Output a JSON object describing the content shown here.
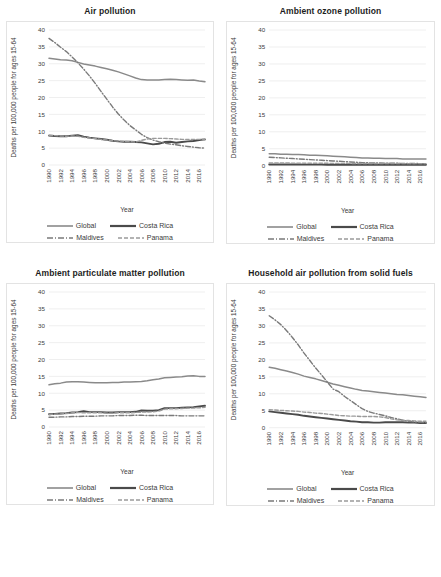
{
  "figure": {
    "caption": "",
    "series_names": [
      "Global",
      "Costa Rica",
      "Maldives",
      "Panama"
    ],
    "axis": {
      "ylabel": "Deaths per 100,000 people for ages 15-64",
      "xlabel": "Year",
      "yticks": [
        "0",
        "5",
        "10",
        "15",
        "20",
        "25",
        "30",
        "35",
        "40"
      ],
      "xticks": [
        "1990",
        "1992",
        "1994",
        "1996",
        "1998",
        "2000",
        "2002",
        "2004",
        "2006",
        "2008",
        "2010",
        "2012",
        "2014",
        "2016"
      ]
    },
    "legend": {
      "global_label": "Global",
      "costa_rica_label": "Costa Rica",
      "maldives_label": "Maldives",
      "panama_label": "Panama"
    },
    "colors": {
      "global": "#8a8a8a",
      "costa_rica": "#4a4a4a",
      "maldives": "#7a7a7a",
      "panama": "#9a9a9a",
      "grid": "#e8e8e8",
      "panel_border": "#e3e3e3",
      "text": "#3b3b3b"
    }
  },
  "chart_data": [
    {
      "type": "line",
      "title": "Air pollution",
      "xlabel": "Year",
      "ylabel": "Deaths per 100,000 people for ages 15-64",
      "ylim": [
        0,
        40
      ],
      "yticks": [
        0,
        5,
        10,
        15,
        20,
        25,
        30,
        35,
        40
      ],
      "grid": true,
      "legend_position": "bottom",
      "x": [
        1990,
        1991,
        1992,
        1993,
        1994,
        1995,
        1996,
        1997,
        1998,
        1999,
        2000,
        2001,
        2002,
        2003,
        2004,
        2005,
        2006,
        2007,
        2008,
        2009,
        2010,
        2011,
        2012,
        2013,
        2014,
        2015,
        2016,
        2017
      ],
      "series": [
        {
          "name": "Global",
          "style": "solid",
          "values": [
            31.6,
            31.4,
            31.2,
            31.1,
            30.9,
            30.4,
            29.9,
            29.6,
            29.3,
            28.9,
            28.5,
            28.1,
            27.6,
            27.0,
            26.4,
            25.8,
            25.3,
            25.2,
            25.2,
            25.2,
            25.3,
            25.4,
            25.3,
            25.2,
            25.1,
            25.2,
            24.9,
            24.7
          ]
        },
        {
          "name": "Costa Rica",
          "style": "solid",
          "values": [
            8.7,
            8.6,
            8.5,
            8.5,
            8.7,
            8.8,
            8.4,
            8.1,
            7.9,
            7.7,
            7.5,
            7.2,
            7.0,
            6.9,
            6.9,
            6.8,
            6.7,
            6.4,
            6.1,
            6.3,
            6.8,
            6.9,
            6.6,
            6.8,
            7.0,
            7.1,
            7.4,
            7.6
          ]
        },
        {
          "name": "Maldives",
          "style": "dashdot",
          "values": [
            37.5,
            36.3,
            34.9,
            33.6,
            32.0,
            30.3,
            28.4,
            26.4,
            24.2,
            21.8,
            19.5,
            17.2,
            15.1,
            13.3,
            11.7,
            10.4,
            9.1,
            8.1,
            7.4,
            6.9,
            6.5,
            6.2,
            6.0,
            5.7,
            5.5,
            5.3,
            5.1,
            5.0
          ]
        },
        {
          "name": "Panama",
          "style": "dashed",
          "values": [
            8.8,
            8.7,
            8.6,
            8.5,
            8.6,
            8.5,
            8.2,
            8.0,
            7.8,
            7.6,
            7.4,
            7.2,
            7.1,
            7.0,
            6.9,
            6.8,
            7.3,
            7.7,
            7.9,
            7.9,
            7.9,
            7.8,
            7.7,
            7.6,
            7.6,
            7.6,
            7.6,
            7.5
          ]
        }
      ]
    },
    {
      "type": "line",
      "title": "Ambient ozone pollution",
      "xlabel": "Year",
      "ylabel": "Deaths per 100,000 people for ages 15-64",
      "ylim": [
        0,
        40
      ],
      "yticks": [
        0,
        5,
        10,
        15,
        20,
        25,
        30,
        35,
        40
      ],
      "grid": true,
      "legend_position": "bottom",
      "x": [
        1990,
        1991,
        1992,
        1993,
        1994,
        1995,
        1996,
        1997,
        1998,
        1999,
        2000,
        2001,
        2002,
        2003,
        2004,
        2005,
        2006,
        2007,
        2008,
        2009,
        2010,
        2011,
        2012,
        2013,
        2014,
        2015,
        2016,
        2017
      ],
      "series": [
        {
          "name": "Global",
          "style": "solid",
          "values": [
            3.5,
            3.5,
            3.4,
            3.4,
            3.3,
            3.3,
            3.2,
            3.1,
            3.1,
            3.0,
            2.9,
            2.8,
            2.7,
            2.6,
            2.5,
            2.4,
            2.3,
            2.3,
            2.2,
            2.2,
            2.1,
            2.1,
            2.1,
            2.0,
            2.0,
            2.0,
            2.0,
            2.0
          ]
        },
        {
          "name": "Costa Rica",
          "style": "solid",
          "values": [
            0.35,
            0.35,
            0.34,
            0.34,
            0.33,
            0.33,
            0.32,
            0.32,
            0.31,
            0.31,
            0.3,
            0.3,
            0.3,
            0.29,
            0.29,
            0.29,
            0.28,
            0.28,
            0.28,
            0.28,
            0.28,
            0.27,
            0.27,
            0.27,
            0.27,
            0.27,
            0.27,
            0.27
          ]
        },
        {
          "name": "Maldives",
          "style": "dashdot",
          "values": [
            2.5,
            2.4,
            2.3,
            2.2,
            2.1,
            2.0,
            1.9,
            1.8,
            1.7,
            1.6,
            1.5,
            1.4,
            1.3,
            1.2,
            1.1,
            1.0,
            0.9,
            0.85,
            0.8,
            0.78,
            0.75,
            0.72,
            0.7,
            0.68,
            0.66,
            0.64,
            0.62,
            0.6
          ]
        },
        {
          "name": "Panama",
          "style": "dashed",
          "values": [
            0.8,
            0.8,
            0.78,
            0.78,
            0.76,
            0.75,
            0.74,
            0.73,
            0.72,
            0.71,
            0.7,
            0.69,
            0.68,
            0.68,
            0.67,
            0.66,
            0.66,
            0.65,
            0.65,
            0.64,
            0.64,
            0.63,
            0.63,
            0.62,
            0.62,
            0.62,
            0.61,
            0.61
          ]
        }
      ]
    },
    {
      "type": "line",
      "title": "Ambient particulate matter pollution",
      "xlabel": "Year",
      "ylabel": "Deaths per 100,000 people for ages 15-64",
      "ylim": [
        0,
        40
      ],
      "yticks": [
        0,
        5,
        10,
        15,
        20,
        25,
        30,
        35,
        40
      ],
      "grid": true,
      "legend_position": "bottom",
      "x": [
        1990,
        1991,
        1992,
        1993,
        1994,
        1995,
        1996,
        1997,
        1998,
        1999,
        2000,
        2001,
        2002,
        2003,
        2004,
        2005,
        2006,
        2007,
        2008,
        2009,
        2010,
        2011,
        2012,
        2013,
        2014,
        2015,
        2016,
        2017
      ],
      "series": [
        {
          "name": "Global",
          "style": "solid",
          "values": [
            12.5,
            12.8,
            13.0,
            13.3,
            13.4,
            13.4,
            13.3,
            13.2,
            13.1,
            13.1,
            13.1,
            13.2,
            13.2,
            13.3,
            13.3,
            13.4,
            13.5,
            13.7,
            14.0,
            14.2,
            14.6,
            14.7,
            14.8,
            14.9,
            15.1,
            15.2,
            15.0,
            15.0
          ]
        },
        {
          "name": "Costa Rica",
          "style": "solid",
          "values": [
            3.8,
            3.9,
            4.0,
            4.1,
            4.3,
            4.4,
            4.7,
            4.4,
            4.4,
            4.4,
            4.3,
            4.3,
            4.4,
            4.4,
            4.4,
            4.5,
            4.9,
            4.8,
            4.8,
            5.0,
            5.6,
            5.6,
            5.6,
            5.7,
            5.8,
            5.9,
            6.1,
            6.3
          ]
        },
        {
          "name": "Maldives",
          "style": "dashdot",
          "values": [
            2.9,
            2.9,
            3.0,
            3.0,
            3.1,
            3.1,
            3.2,
            3.2,
            3.2,
            3.3,
            3.3,
            3.3,
            3.4,
            3.4,
            3.4,
            3.5,
            3.5,
            3.4,
            3.4,
            3.4,
            3.4,
            3.4,
            3.4,
            3.3,
            3.3,
            3.3,
            3.3,
            3.3
          ]
        },
        {
          "name": "Panama",
          "style": "dashed",
          "values": [
            3.7,
            3.8,
            3.9,
            4.0,
            4.2,
            4.3,
            4.2,
            4.2,
            4.2,
            4.2,
            4.1,
            4.1,
            4.2,
            4.2,
            4.2,
            4.3,
            4.4,
            4.4,
            4.5,
            4.7,
            5.3,
            5.4,
            5.4,
            5.5,
            5.6,
            5.6,
            5.7,
            5.8
          ]
        }
      ]
    },
    {
      "type": "line",
      "title": "Household air pollution from solid fuels",
      "xlabel": "Year",
      "ylabel": "Deaths per 100,000 people for ages 15-64",
      "ylim": [
        0,
        40
      ],
      "yticks": [
        0,
        5,
        10,
        15,
        20,
        25,
        30,
        35,
        40
      ],
      "grid": true,
      "legend_position": "bottom",
      "x": [
        1990,
        1991,
        1992,
        1993,
        1994,
        1995,
        1996,
        1997,
        1998,
        1999,
        2000,
        2001,
        2002,
        2003,
        2004,
        2005,
        2006,
        2007,
        2008,
        2009,
        2010,
        2011,
        2012,
        2013,
        2014,
        2015,
        2016,
        2017
      ],
      "series": [
        {
          "name": "Global",
          "style": "solid",
          "values": [
            17.8,
            17.5,
            17.1,
            16.7,
            16.3,
            15.8,
            15.2,
            14.8,
            14.4,
            13.9,
            13.4,
            12.9,
            12.5,
            12.1,
            11.7,
            11.3,
            11.0,
            10.8,
            10.6,
            10.4,
            10.2,
            10.0,
            9.8,
            9.7,
            9.5,
            9.3,
            9.1,
            8.9
          ]
        },
        {
          "name": "Costa Rica",
          "style": "solid",
          "values": [
            4.8,
            4.6,
            4.4,
            4.2,
            4.0,
            3.8,
            3.5,
            3.3,
            3.1,
            2.9,
            2.7,
            2.5,
            2.3,
            2.1,
            1.9,
            1.8,
            1.6,
            1.6,
            1.5,
            1.5,
            1.6,
            1.6,
            1.6,
            1.6,
            1.5,
            1.5,
            1.4,
            1.4
          ]
        },
        {
          "name": "Maldives",
          "style": "dashdot",
          "values": [
            33.0,
            31.8,
            30.4,
            28.6,
            26.6,
            24.4,
            22.0,
            19.8,
            17.6,
            15.6,
            13.5,
            11.4,
            10.6,
            9.2,
            8.0,
            6.8,
            5.6,
            4.8,
            4.3,
            3.9,
            3.5,
            3.0,
            2.6,
            2.2,
            1.9,
            1.7,
            1.6,
            1.5
          ]
        },
        {
          "name": "Panama",
          "style": "dashed",
          "values": [
            5.3,
            5.2,
            5.1,
            5.0,
            4.9,
            4.8,
            4.6,
            4.5,
            4.3,
            4.2,
            4.0,
            3.8,
            3.6,
            3.5,
            3.4,
            3.4,
            3.3,
            3.3,
            3.3,
            3.2,
            3.0,
            2.6,
            2.3,
            2.2,
            2.1,
            2.0,
            1.9,
            1.9
          ]
        }
      ]
    }
  ]
}
